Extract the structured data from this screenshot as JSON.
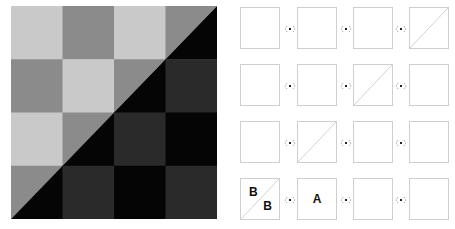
{
  "board": {
    "rows": 4,
    "cols": 4,
    "colors": {
      "light": "#c9c9c9",
      "medium": "#8b8b8b",
      "dark": "#2a2a2a",
      "black": "#050505"
    },
    "diagonal": "bottom-left to top-right",
    "upper_region_pattern": [
      "light",
      "medium"
    ],
    "lower_region_pattern": [
      "dark",
      "black"
    ]
  },
  "tiles": {
    "border_color": "#cfcfcf",
    "rows": [
      {
        "cells": [
          {
            "diagonal": false,
            "labels": []
          },
          {
            "diagonal": false,
            "labels": []
          },
          {
            "diagonal": false,
            "labels": []
          },
          {
            "diagonal": true,
            "labels": []
          }
        ]
      },
      {
        "cells": [
          {
            "diagonal": false,
            "labels": []
          },
          {
            "diagonal": false,
            "labels": []
          },
          {
            "diagonal": true,
            "labels": []
          },
          {
            "diagonal": false,
            "labels": []
          }
        ]
      },
      {
        "cells": [
          {
            "diagonal": false,
            "labels": []
          },
          {
            "diagonal": true,
            "labels": []
          },
          {
            "diagonal": false,
            "labels": []
          },
          {
            "diagonal": false,
            "labels": []
          }
        ]
      },
      {
        "cells": [
          {
            "diagonal": true,
            "labels": [
              "B",
              "B"
            ]
          },
          {
            "diagonal": false,
            "labels": [
              "A"
            ]
          },
          {
            "diagonal": false,
            "labels": []
          },
          {
            "diagonal": false,
            "labels": []
          }
        ]
      }
    ],
    "row_labels": {
      "r4c1_top": "B",
      "r4c1_bottom": "B",
      "r4c2_center": "A"
    },
    "connector_icon": "swap-connector-icon"
  }
}
